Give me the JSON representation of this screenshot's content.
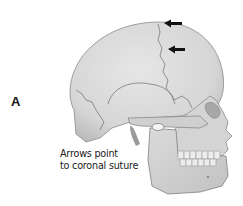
{
  "figure": {
    "panel_label": "A",
    "caption_lines": [
      "Arrows point",
      "to coronal suture"
    ],
    "colors": {
      "bone_fill": "#dcdcdc",
      "bone_shadow": "#bdbdbd",
      "suture_line": "#6b6b6b",
      "arrow": "#111111",
      "background": "#ffffff"
    },
    "arrows": [
      {
        "label": "coronal-suture-arrow-upper",
        "direction": "left"
      },
      {
        "label": "coronal-suture-arrow-lower",
        "direction": "left"
      }
    ]
  }
}
